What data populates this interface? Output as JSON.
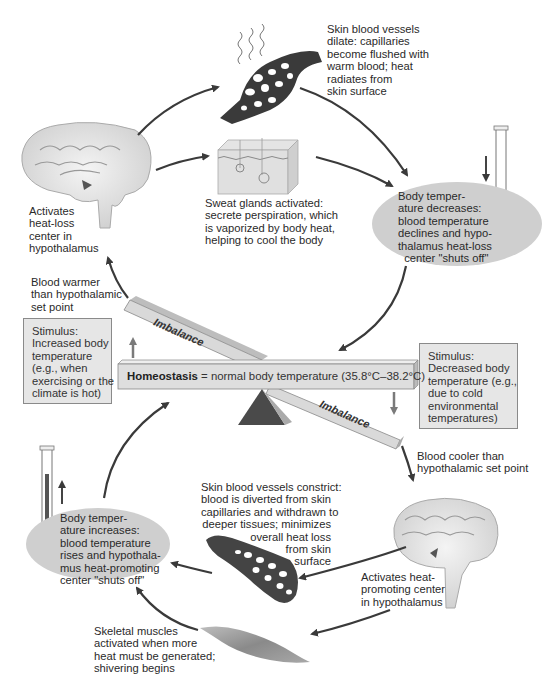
{
  "diagram": {
    "center": {
      "bold_label": "Homeostasis",
      "rest_label": " = normal body temperature (35.8°C–38.2°C)",
      "imbalance_top": "Imbalance",
      "imbalance_bottom": "Imbalance"
    },
    "heat_loss_loop": {
      "stimulus": "Stimulus:\nIncreased body\ntemperature\n(e.g., when\nexercising or the\nclimate is hot)",
      "receptor_text": "Blood warmer\nthan hypothalamic\nset point",
      "control_center": "Activates\nheat-loss\ncenter in\nhypothalamus",
      "effector_vessels": "Skin blood vessels\ndilate: capillaries\nbecome flushed with\nwarm blood; heat\nradiates from\nskin surface",
      "effector_sweat": "Sweat glands activated:\nsecrete perspiration, which\nis vaporized by body heat,\nhelping to cool the body",
      "result": "Body temper-\nature decreases:\nblood temperature\ndeclines and hypo-\nthalamus heat-loss\n  center \"shuts off\""
    },
    "heat_promoting_loop": {
      "stimulus": "Stimulus:\nDecreased body\ntemperature (e.g.,\ndue to cold\nenvironmental\ntemperatures)",
      "receptor_text": "Blood cooler than\nhypothalamic set point",
      "control_center": "Activates heat-\npromoting center\nin hypothalamus",
      "effector_vessels": "Skin blood vessels constrict:\nblood is diverted from skin\ncapillaries and withdrawn to\ndeeper tissues; minimizes\noverall heat loss\nfrom skin\nsurface",
      "effector_muscles": "Skeletal muscles\nactivated when more\nheat must be generated;\nshivering begins",
      "result": "Body temper-\nature increases:\nblood temperature\nrises and hypothala-\nmus heat-promoting\ncenter \"shuts off\""
    },
    "colors": {
      "oval_fill": "#cfcfcf",
      "stimulus_box_fill": "#e6e6e6",
      "beam_fill": "#d9d9d9",
      "arrow": "#3a3a3a",
      "fulcrum": "#4a4a4a",
      "thermometer_mercury": "#555555"
    }
  }
}
